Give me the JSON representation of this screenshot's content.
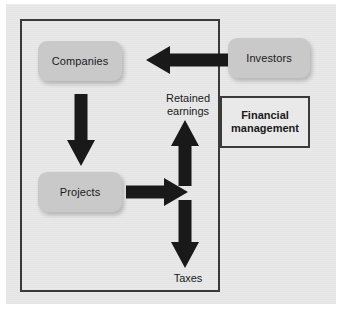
{
  "diagram": {
    "background_color": "#e9e9e9",
    "border_color": "#3a3a3a",
    "entity_fill_color": "#c9c9c9",
    "arrow_color": "#191919",
    "boundary": {
      "name": "firm-boundary",
      "label": ""
    },
    "nodes": [
      {
        "id": "companies",
        "label": "Companies",
        "shape": "rounded-rect",
        "fill": "#c9c9c9"
      },
      {
        "id": "projects",
        "label": "Projects",
        "shape": "rounded-rect",
        "fill": "#c9c9c9"
      },
      {
        "id": "investors",
        "label": "Investors",
        "shape": "rounded-rect",
        "fill": "#c9c9c9"
      },
      {
        "id": "financial-management",
        "label": "Financial\nmanagement",
        "line1": "Financial",
        "line2": "management",
        "shape": "rect",
        "bold": true
      }
    ],
    "labels": [
      {
        "id": "retained-earnings",
        "line1": "Retained",
        "line2": "earnings"
      },
      {
        "id": "taxes",
        "text": "Taxes"
      }
    ],
    "edges": [
      {
        "id": "investors-to-companies",
        "from": "investors",
        "to": "companies",
        "direction": "left"
      },
      {
        "id": "companies-to-projects",
        "from": "companies",
        "to": "projects",
        "direction": "down"
      },
      {
        "id": "projects-to-hub",
        "from": "projects",
        "to": "cash-hub",
        "direction": "right"
      },
      {
        "id": "hub-to-retained-earnings",
        "from": "cash-hub",
        "to": "retained-earnings",
        "direction": "up"
      },
      {
        "id": "hub-to-taxes",
        "from": "cash-hub",
        "to": "taxes",
        "direction": "down"
      }
    ]
  }
}
